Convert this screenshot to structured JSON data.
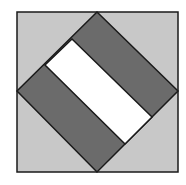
{
  "figure": {
    "colors": {
      "background": "#ffffff",
      "square_fill": "#c8c8c8",
      "dark_band": "#6b6b6b",
      "light_band": "#ffffff",
      "stroke": "#1a1a1a"
    },
    "outer_square": {
      "x": 17,
      "y": 12,
      "width": 161,
      "height": 160
    },
    "diamond": {
      "top": [
        97,
        12
      ],
      "right": [
        178,
        91
      ],
      "bottom": [
        97,
        172
      ],
      "left": [
        17,
        91
      ]
    },
    "white_band": {
      "points": [
        [
          72,
          39
        ],
        [
          152,
          117
        ],
        [
          125,
          144
        ],
        [
          45,
          65
        ]
      ]
    }
  }
}
